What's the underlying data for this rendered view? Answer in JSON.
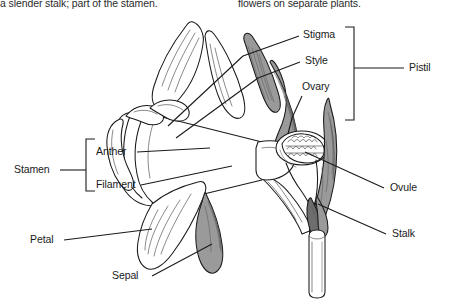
{
  "page": {
    "width": 454,
    "height": 302,
    "background_color": "#ffffff",
    "ink_color": "#1a1a1a"
  },
  "caption": {
    "left_fragment": "a slender stalk; part of the stamen.",
    "right_fragment": "flowers on separate plants."
  },
  "diagram": {
    "title_visible": false
  },
  "labels": {
    "stigma": "Stigma",
    "style": "Style",
    "ovary": "Ovary",
    "pistil": "Pistil",
    "ovule": "Ovule",
    "stalk": "Stalk",
    "stamen": "Stamen",
    "anther": "Anther",
    "filament": "Filament",
    "petal": "Petal",
    "sepal": "Sepal"
  },
  "groups": {
    "pistil_members": [
      "Stigma",
      "Style",
      "Ovary"
    ],
    "stamen_members": [
      "Anther",
      "Filament"
    ]
  }
}
